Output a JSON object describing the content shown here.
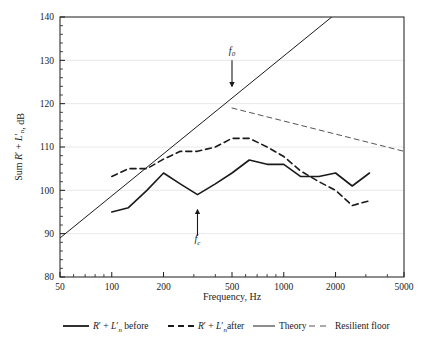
{
  "chart_data": {
    "type": "line",
    "title": "",
    "xlabel": "Frequency, Hz",
    "ylabel": "Sum R' + L'n, dB",
    "xscale": "log",
    "xlim": [
      50,
      5000
    ],
    "ylim": [
      80,
      140
    ],
    "xticks": [
      50,
      100,
      200,
      500,
      1000,
      2000,
      5000
    ],
    "xticklabels": [
      "50",
      "100",
      "200",
      "500",
      "1000",
      "2000",
      "5000"
    ],
    "yticks": [
      80,
      90,
      100,
      110,
      120,
      130,
      140
    ],
    "yticklabels": [
      "80",
      "90",
      "100",
      "110",
      "120",
      "130",
      "140"
    ],
    "grid": "horizontal",
    "legend_position": "below",
    "series": [
      {
        "name": "R' + L'n before",
        "style": "solid",
        "width": 1.6,
        "color": "#1a1a1a",
        "points": [
          [
            100,
            95.0
          ],
          [
            125,
            96.0
          ],
          [
            160,
            100.0
          ],
          [
            200,
            104.0
          ],
          [
            250,
            101.5
          ],
          [
            315,
            99.0
          ],
          [
            400,
            101.5
          ],
          [
            500,
            104.0
          ],
          [
            630,
            107.0
          ],
          [
            800,
            106.0
          ],
          [
            1000,
            106.0
          ],
          [
            1250,
            103.2
          ],
          [
            1600,
            103.2
          ],
          [
            2000,
            104.0
          ],
          [
            2500,
            101.0
          ],
          [
            3150,
            104.0
          ]
        ]
      },
      {
        "name": "R' + L'n after",
        "style": "dashed",
        "width": 1.6,
        "color": "#1a1a1a",
        "points": [
          [
            100,
            103.2
          ],
          [
            125,
            105.0
          ],
          [
            160,
            105.0
          ],
          [
            200,
            107.2
          ],
          [
            250,
            109.0
          ],
          [
            315,
            109.0
          ],
          [
            400,
            110.0
          ],
          [
            500,
            112.0
          ],
          [
            630,
            112.0
          ],
          [
            800,
            110.0
          ],
          [
            1000,
            107.8
          ],
          [
            1250,
            104.5
          ],
          [
            1600,
            102.0
          ],
          [
            2000,
            100.0
          ],
          [
            2500,
            96.5
          ],
          [
            3150,
            97.6
          ]
        ]
      },
      {
        "name": "Theory",
        "style": "solid",
        "width": 1.0,
        "color": "#1a1a1a",
        "points": [
          [
            50,
            89.0
          ],
          [
            1900,
            140.0
          ]
        ]
      },
      {
        "name": "Resilient floor",
        "style": "dashed",
        "width": 1.0,
        "color": "#555555",
        "points": [
          [
            500,
            119.0
          ],
          [
            5000,
            109.0
          ]
        ]
      }
    ],
    "annotations": [
      {
        "label": "f0",
        "label_base": "f",
        "label_sub": "0",
        "x": 500,
        "y_text": 131.5,
        "arrow_from_y": 130.0,
        "arrow_to_y": 124.0,
        "direction": "down"
      },
      {
        "label": "fc",
        "label_base": "f",
        "label_sub": "c",
        "x": 315,
        "y_text": 88.0,
        "arrow_from_y": 89.5,
        "arrow_to_y": 95.5,
        "direction": "up"
      }
    ]
  },
  "legend": {
    "items": [
      {
        "label_main": "R",
        "label_prime": "′",
        "label_plus": " + ",
        "label_l": "L",
        "label_l_prime": "′",
        "label_sub": "n",
        "label_tail": " before",
        "style": "solid",
        "name": "before"
      },
      {
        "label_main": "R",
        "label_prime": "′",
        "label_plus": " + ",
        "label_l": "L",
        "label_l_prime": "′",
        "label_sub": "n",
        "label_tail": "after",
        "style": "dashed",
        "name": "after"
      },
      {
        "label_tail": "Theory",
        "style": "solid-thin",
        "name": "theory"
      },
      {
        "label_tail": "Resilient floor",
        "style": "dashed-thin",
        "name": "resilient-floor"
      }
    ]
  },
  "axes": {
    "x_title": "Frequency, Hz",
    "y_title_sum": "Sum ",
    "y_title_r": "R",
    "y_title_prime": "′",
    "y_title_plus": " + ",
    "y_title_l": "L",
    "y_title_l_prime": "′",
    "y_title_sub": "n",
    "y_title_tail": ", dB"
  },
  "colors": {
    "ink": "#1a1a1a",
    "grid": "#e8e8e8",
    "resilient": "#555555",
    "background": "#ffffff"
  }
}
